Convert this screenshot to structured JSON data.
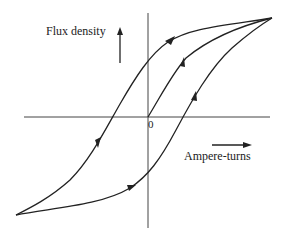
{
  "diagram": {
    "y_axis_label": "Flux density",
    "x_axis_label": "Ampere-turns",
    "origin_label": "0",
    "line_color": "#222222",
    "background": "#ffffff",
    "curves": [
      {
        "name": "initial-magnetization",
        "from": "origin",
        "to": "positive-saturation",
        "direction": "up-right"
      },
      {
        "name": "descending-branch",
        "from": "positive-saturation",
        "to": "negative-saturation",
        "direction": "down-left"
      },
      {
        "name": "ascending-branch",
        "from": "negative-saturation",
        "to": "positive-saturation",
        "direction": "up-right"
      }
    ],
    "arrows": {
      "y_axis_direction": "up",
      "x_axis_direction": "right"
    }
  }
}
